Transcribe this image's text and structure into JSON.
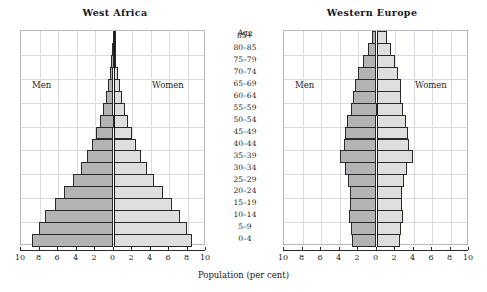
{
  "figure": {
    "xlabel": "Population (per cent)",
    "age_header": "Age",
    "men_label": "Men",
    "women_label": "Women",
    "colors": {
      "men_fill": "#b3b3b3",
      "women_fill": "#dedede",
      "bar_stroke": "#2a2a2a",
      "grid": "#d9d9e2",
      "axis": "#1a1a1a",
      "text": "#1c1c20"
    }
  },
  "age_groups": [
    "85+",
    "80–85",
    "75–79",
    "70–74",
    "65–69",
    "60–64",
    "55–59",
    "50–54",
    "45–49",
    "40–44",
    "35–39",
    "30–34",
    "25–29",
    "20–24",
    "15–19",
    "10–14",
    "5–9",
    "0–4"
  ],
  "tick_labels": [
    "10",
    "8",
    "6",
    "4",
    "2",
    "0",
    "2",
    "4",
    "6",
    "8",
    "10"
  ],
  "tick_values": [
    -10,
    -8,
    -6,
    -4,
    -2,
    0,
    2,
    4,
    6,
    8,
    10
  ],
  "chart_data": [
    {
      "type": "bar",
      "subtype": "population-pyramid",
      "title": "West Africa",
      "xlabel": "Population (per cent)",
      "ylabel": "Age",
      "xlim": [
        -10,
        10
      ],
      "xtick_absolute": [
        10,
        8,
        6,
        4,
        2,
        0,
        2,
        4,
        6,
        8,
        10
      ],
      "grid": true,
      "legend": [
        "Men",
        "Women"
      ],
      "legend_position": "inside-left-and-right",
      "categories": [
        "85+",
        "80–85",
        "75–79",
        "70–74",
        "65–69",
        "60–64",
        "55–59",
        "50–54",
        "45–49",
        "40–44",
        "35–39",
        "30–34",
        "25–29",
        "20–24",
        "15–19",
        "10–14",
        "5–9",
        "0–4"
      ],
      "series": [
        {
          "name": "Men",
          "values": [
            0.1,
            0.15,
            0.25,
            0.4,
            0.6,
            0.85,
            1.15,
            1.5,
            1.9,
            2.35,
            2.9,
            3.55,
            4.35,
            5.3,
            6.35,
            7.4,
            8.1,
            8.8
          ]
        },
        {
          "name": "Women",
          "values": [
            0.12,
            0.18,
            0.3,
            0.45,
            0.65,
            0.9,
            1.2,
            1.55,
            1.95,
            2.4,
            2.95,
            3.6,
            4.4,
            5.3,
            6.3,
            7.2,
            7.9,
            8.5
          ]
        }
      ]
    },
    {
      "type": "bar",
      "subtype": "population-pyramid",
      "title": "Western Europe",
      "xlabel": "Population (per cent)",
      "ylabel": "Age",
      "xlim": [
        -10,
        10
      ],
      "xtick_absolute": [
        10,
        8,
        6,
        4,
        2,
        0,
        2,
        4,
        6,
        8,
        10
      ],
      "grid": true,
      "legend": [
        "Men",
        "Women"
      ],
      "legend_position": "inside-left-and-right",
      "categories": [
        "85+",
        "80–85",
        "75–79",
        "70–74",
        "65–69",
        "60–64",
        "55–59",
        "50–54",
        "45–49",
        "40–44",
        "35–39",
        "30–34",
        "25–29",
        "20–24",
        "15–19",
        "10–14",
        "5–9",
        "0–4"
      ],
      "series": [
        {
          "name": "Men",
          "values": [
            0.45,
            0.95,
            1.45,
            1.95,
            2.35,
            2.55,
            2.75,
            3.15,
            3.45,
            3.55,
            3.95,
            3.4,
            3.05,
            2.85,
            2.9,
            2.95,
            2.8,
            2.65
          ]
        },
        {
          "name": "Women",
          "values": [
            1.1,
            1.55,
            2.0,
            2.35,
            2.6,
            2.7,
            2.85,
            3.2,
            3.45,
            3.55,
            3.9,
            3.35,
            3.0,
            2.8,
            2.8,
            2.85,
            2.7,
            2.55
          ]
        }
      ]
    }
  ]
}
